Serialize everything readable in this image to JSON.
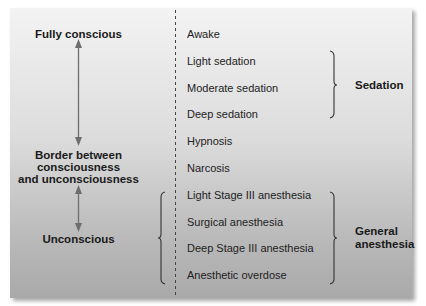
{
  "diagram": {
    "left_states": [
      {
        "id": "fully-conscious",
        "label": "Fully conscious"
      },
      {
        "id": "border",
        "lines": [
          "Border between",
          "consciousness",
          "and unconsciousness"
        ]
      },
      {
        "id": "unconscious",
        "label": "Unconscious"
      }
    ],
    "levels": [
      "Awake",
      "Light sedation",
      "Moderate sedation",
      "Deep sedation",
      "Hypnosis",
      "Narcosis",
      "Light Stage III anesthesia",
      "Surgical anesthesia",
      "Deep Stage III anesthesia",
      "Anesthetic overdose"
    ],
    "groups": [
      {
        "id": "sedation",
        "lines": [
          "Sedation"
        ],
        "spans": [
          "Light sedation",
          "Moderate sedation",
          "Deep sedation"
        ]
      },
      {
        "id": "general-anesthesia",
        "lines": [
          "General",
          "anesthesia"
        ],
        "spans": [
          "Light Stage III anesthesia",
          "Surgical anesthesia",
          "Deep Stage III anesthesia",
          "Anesthetic overdose"
        ]
      }
    ],
    "colors": {
      "arrow": "#6e6e6e",
      "brace": "#333333",
      "divider": "#444444",
      "gradient_top": "#f3f3f3",
      "gradient_bottom": "#a9a9a9"
    }
  }
}
